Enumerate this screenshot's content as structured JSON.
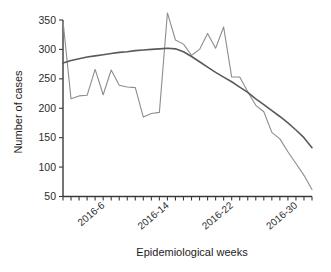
{
  "chart_data": {
    "type": "line",
    "title": "",
    "xlabel": "Epidemiological weeks",
    "ylabel": "Number of cases",
    "ylim": [
      50,
      350
    ],
    "yticks": [
      50,
      100,
      150,
      200,
      250,
      300,
      350
    ],
    "ytick_labels": [
      "50",
      "100",
      "150",
      "200",
      "250",
      "300",
      "350"
    ],
    "xlim": [
      1,
      32
    ],
    "xticks": [
      6,
      14,
      22,
      30
    ],
    "xtick_labels": [
      "2016-6",
      "2016-14",
      "2016-22",
      "2016-30"
    ],
    "grid": false,
    "legend": "none",
    "x": [
      1,
      2,
      3,
      4,
      5,
      6,
      7,
      8,
      9,
      10,
      11,
      12,
      13,
      14,
      15,
      16,
      17,
      18,
      19,
      20,
      21,
      22,
      23,
      24,
      25,
      26,
      27,
      28,
      29,
      30,
      31,
      32
    ],
    "series": [
      {
        "name": "observed",
        "color": "#8d8d8d",
        "values": [
          348,
          216,
          221,
          222,
          266,
          223,
          265,
          239,
          236,
          235,
          185,
          191,
          193,
          362,
          316,
          309,
          290,
          300,
          327,
          302,
          338,
          253,
          253,
          228,
          205,
          194,
          159,
          148,
          126,
          106,
          86,
          62
        ]
      },
      {
        "name": "trend",
        "color": "#5a5a5a",
        "values": [
          277,
          281,
          284,
          287,
          289,
          291,
          293,
          295,
          296,
          298,
          299,
          300,
          301,
          302,
          301,
          296,
          288,
          279,
          270,
          261,
          253,
          245,
          236,
          227,
          216,
          206,
          196,
          186,
          175,
          163,
          150,
          133
        ]
      }
    ]
  },
  "axes": {
    "y_axis_label": "Number of cases",
    "x_axis_label": "Epidemiological weeks"
  }
}
